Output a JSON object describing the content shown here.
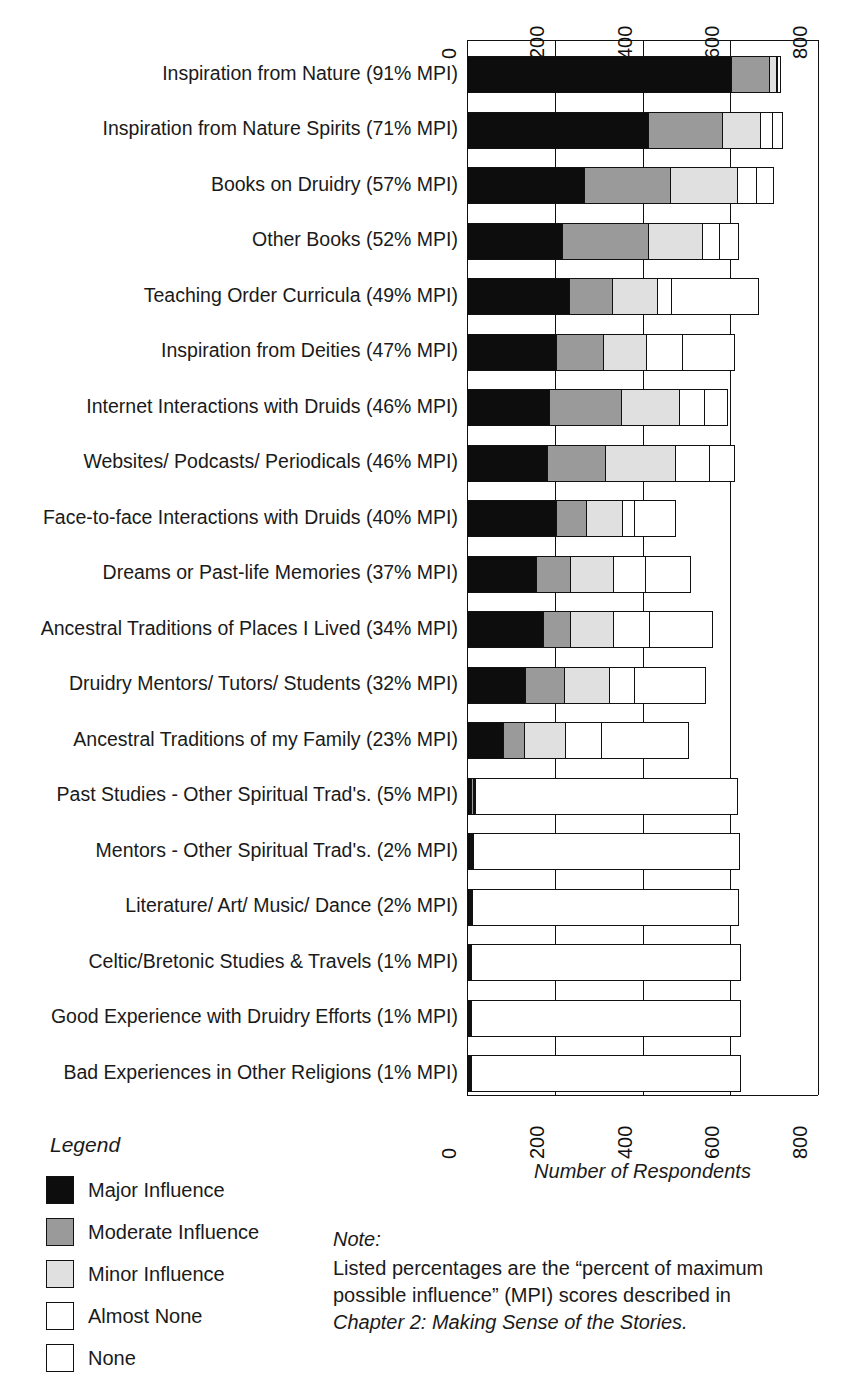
{
  "chart_data": {
    "type": "bar",
    "subtype": "horizontal stacked bar",
    "title": "",
    "xlabel": "Number of Respondents",
    "ylabel": "",
    "xlim": [
      0,
      800
    ],
    "xticks": [
      0,
      200,
      400,
      600,
      800
    ],
    "xtick_labels": [
      "0",
      "200",
      "400",
      "600",
      "800"
    ],
    "grid": true,
    "axis_top_labels": true,
    "legend_position": "bottom-left",
    "series": [
      {
        "name": "Major Influence",
        "color": "#0d0d0d",
        "values": [
          605,
          415,
          270,
          218,
          235,
          205,
          190,
          185,
          205,
          160,
          175,
          135,
          85,
          12,
          8,
          6,
          3,
          3,
          3
        ]
      },
      {
        "name": "Moderate Influence",
        "color": "#9a9a9a",
        "values": [
          88,
          170,
          198,
          200,
          100,
          110,
          165,
          135,
          70,
          80,
          65,
          90,
          50,
          6,
          4,
          5,
          2,
          2,
          2
        ]
      },
      {
        "name": "Minor Influence",
        "color": "#e0e0e0",
        "values": [
          18,
          90,
          155,
          125,
          105,
          100,
          135,
          160,
          85,
          100,
          100,
          105,
          95,
          2,
          2,
          2,
          1,
          1,
          1
        ]
      },
      {
        "name": "Almost None",
        "color": "#ffffff",
        "values": [
          5,
          30,
          45,
          40,
          35,
          85,
          60,
          80,
          30,
          75,
          85,
          60,
          85,
          2,
          2,
          2,
          1,
          1,
          1
        ]
      },
      {
        "name": "None",
        "color": "#ffffff",
        "values": [
          8,
          25,
          40,
          45,
          200,
          120,
          55,
          60,
          95,
          105,
          145,
          165,
          200,
          600,
          610,
          610,
          615,
          615,
          615
        ]
      }
    ],
    "categories": [
      "Inspiration from Nature (91% MPI)",
      "Inspiration from Nature Spirits (71% MPI)",
      "Books on Druidry (57% MPI)",
      "Other Books (52% MPI)",
      "Teaching Order Curricula (49% MPI)",
      "Inspiration from Deities (47% MPI)",
      "Internet Interactions with Druids (46% MPI)",
      "Websites/ Podcasts/ Periodicals (46% MPI)",
      "Face-to-face Interactions with Druids (40% MPI)",
      "Dreams or Past-life Memories (37% MPI)",
      "Ancestral Traditions of Places I Lived (34% MPI)",
      "Druidry Mentors/ Tutors/ Students (32% MPI)",
      "Ancestral Traditions of my Family (23% MPI)",
      "Past Studies - Other Spiritual Trad's. (5% MPI)",
      "Mentors - Other Spiritual Trad's. (2% MPI)",
      "Literature/ Art/ Music/ Dance (2% MPI)",
      "Celtic/Bretonic Studies & Travels (1% MPI)",
      "Good Experience with Druidry Efforts (1% MPI)",
      "Bad Experiences in Other Religions (1% MPI)"
    ]
  },
  "legend": {
    "title": "Legend",
    "items": [
      {
        "label": "Major Influence",
        "color": "#0d0d0d"
      },
      {
        "label": "Moderate Influence",
        "color": "#9a9a9a"
      },
      {
        "label": "Minor Influence",
        "color": "#e0e0e0"
      },
      {
        "label": "Almost None",
        "color": "#ffffff"
      },
      {
        "label": "None",
        "color": "#ffffff"
      }
    ]
  },
  "note": {
    "title": "Note:",
    "lines": [
      {
        "text": "Listed percentages are the “percent of maximum",
        "italic": false
      },
      {
        "text": "possible influence” (MPI) scores described in",
        "italic": false
      },
      {
        "text": "Chapter 2: Making Sense of the Stories.",
        "italic": true
      }
    ]
  },
  "axis_title": "Number of Respondents"
}
